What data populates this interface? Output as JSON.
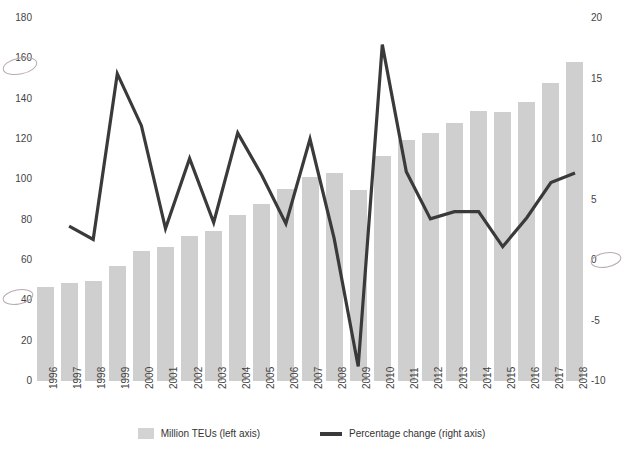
{
  "chart_data": {
    "type": "bar",
    "title": "",
    "xlabel": "",
    "ylabel": "",
    "categories": [
      "1996",
      "1997",
      "1998",
      "1999",
      "2000",
      "2001",
      "2002",
      "2003",
      "2004",
      "2005",
      "2006",
      "2007",
      "2008",
      "2009",
      "2010",
      "2011",
      "2012",
      "2013",
      "2014",
      "2015",
      "2016",
      "2017",
      "2018"
    ],
    "series": [
      {
        "name": "Million TEUs (left axis)",
        "type": "bar",
        "axis": "left",
        "color": "#cfcfcf",
        "values": [
          46.5,
          48.5,
          49.5,
          57.0,
          64.5,
          66.5,
          72.0,
          74.5,
          82.5,
          88.0,
          95.0,
          101.0,
          103.0,
          94.5,
          111.5,
          119.5,
          123.0,
          128.0,
          134.0,
          133.5,
          138.5,
          148.0,
          158.0
        ]
      },
      {
        "name": "Percentage change (right axis)",
        "type": "line",
        "axis": "right",
        "color": "#3a3a3a",
        "values": [
          null,
          2.8,
          1.7,
          15.4,
          11.1,
          2.6,
          8.4,
          3.1,
          10.5,
          7.0,
          3.0,
          10.0,
          1.8,
          -8.8,
          17.8,
          7.3,
          3.4,
          4.0,
          4.0,
          1.1,
          3.5,
          6.4,
          7.2
        ]
      }
    ],
    "left_axis": {
      "ticks": [
        0,
        20,
        40,
        60,
        80,
        100,
        120,
        140,
        160,
        180
      ],
      "ylim": [
        0,
        180
      ],
      "label": "Million TEUs"
    },
    "right_axis": {
      "ticks": [
        -10,
        -5,
        0,
        5,
        10,
        15,
        20
      ],
      "ylim": [
        -10,
        20
      ],
      "label": "Percentage change"
    },
    "grid": false,
    "legend_position": "bottom"
  },
  "legend": {
    "bar_label": "Million TEUs (left axis)",
    "line_label": "Percentage change (right axis)"
  },
  "colors": {
    "bar": "#cfcfcf",
    "line": "#3a3a3a",
    "text": "#444444",
    "background": "#ffffff"
  }
}
